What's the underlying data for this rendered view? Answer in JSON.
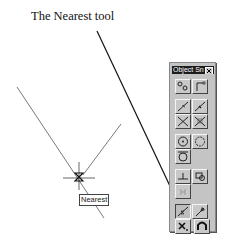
{
  "caption": "The Nearest tool",
  "tooltip": "Nearest",
  "toolbar": {
    "title": "Object Sn",
    "close_icon": "close-icon",
    "buttons": [
      {
        "name": "snap-from",
        "icon": "snap-from-icon"
      },
      {
        "name": "snap-endpoint",
        "icon": "endpoint-icon"
      },
      {
        "name": "snap-midpoint",
        "icon": "midpoint-icon"
      },
      {
        "name": "snap-intersection",
        "icon": "intersection-icon"
      },
      {
        "name": "snap-apparent-intersection",
        "icon": "apparent-intersection-icon"
      },
      {
        "name": "snap-center",
        "icon": "center-icon"
      },
      {
        "name": "snap-quadrant",
        "icon": "quadrant-icon"
      },
      {
        "name": "snap-tangent",
        "icon": "tangent-icon"
      },
      {
        "name": "snap-perpendicular",
        "icon": "perpendicular-icon"
      },
      {
        "name": "snap-insert",
        "icon": "insert-icon"
      },
      {
        "name": "snap-node",
        "icon": "node-icon"
      },
      {
        "name": "snap-nearest",
        "icon": "nearest-icon"
      },
      {
        "name": "snap-quick",
        "icon": "quick-icon"
      },
      {
        "name": "snap-none",
        "icon": "none-icon"
      },
      {
        "name": "osnap-settings",
        "icon": "magnet-icon"
      }
    ]
  },
  "colors": {
    "drawing_line": "#666666",
    "leader_line": "#111111",
    "toolbar_bg": "#c4c4c4",
    "title_bar": "#1c1c1c"
  }
}
